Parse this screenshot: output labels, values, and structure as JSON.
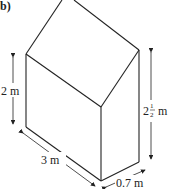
{
  "part_label": "b)",
  "labels": {
    "left_height": "2 m",
    "right_height_whole": "2",
    "right_height_num": "1",
    "right_height_den": "2",
    "right_height_unit": "m",
    "length": "3 m",
    "width": "0.7 m"
  },
  "colors": {
    "line": "#222222",
    "background": "#ffffff"
  }
}
